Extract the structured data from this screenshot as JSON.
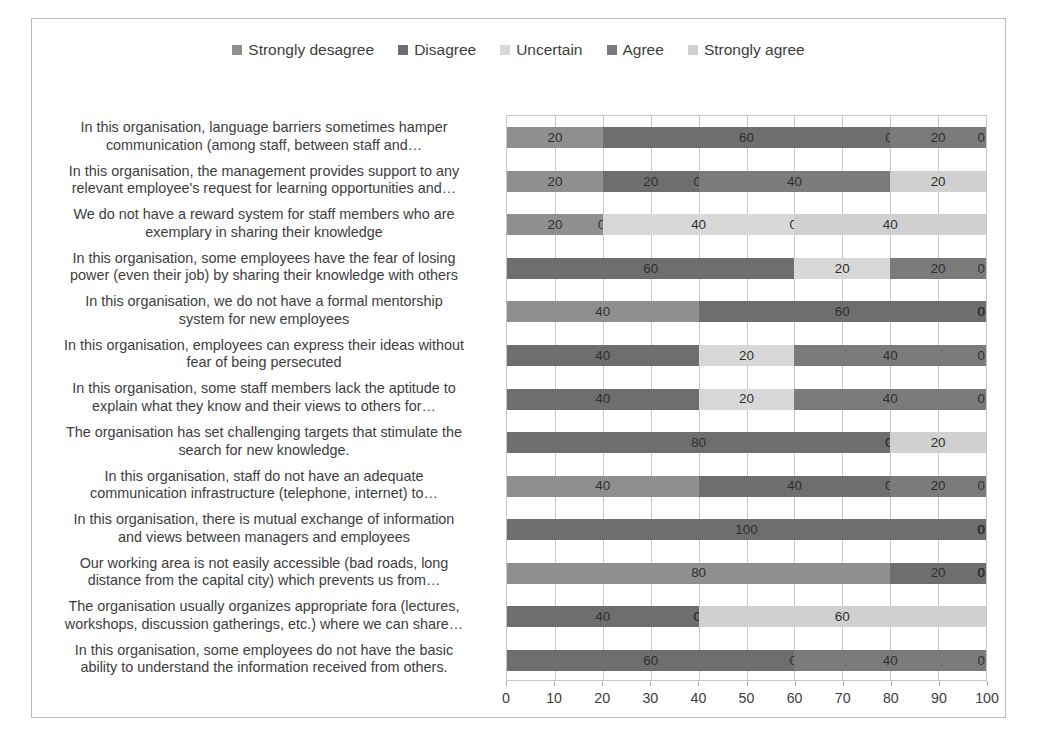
{
  "chart_data": {
    "type": "bar",
    "subtype": "stacked-horizontal-100",
    "title": "",
    "xlabel": "",
    "ylabel": "",
    "xlim": [
      0,
      100
    ],
    "xticks": [
      "0",
      "10",
      "20",
      "30",
      "40",
      "50",
      "60",
      "70",
      "80",
      "90",
      "100"
    ],
    "grid": true,
    "legend_position": "top-center",
    "series": [
      {
        "name": "Strongly desagree",
        "color": "#8f8f8f",
        "values": [
          20,
          20,
          20,
          0,
          40,
          0,
          0,
          0,
          40,
          0,
          80,
          0,
          0
        ]
      },
      {
        "name": "Disagree",
        "color": "#6e6e6e",
        "values": [
          60,
          20,
          0,
          60,
          60,
          40,
          40,
          80,
          40,
          100,
          20,
          40,
          60
        ]
      },
      {
        "name": "Uncertain",
        "color": "#d8d8d8",
        "values": [
          0,
          0,
          40,
          20,
          0,
          20,
          20,
          0,
          0,
          0,
          0,
          0,
          0
        ]
      },
      {
        "name": "Agree",
        "color": "#7b7b7b",
        "values": [
          20,
          40,
          0,
          20,
          0,
          40,
          40,
          0,
          20,
          0,
          0,
          0,
          40
        ]
      },
      {
        "name": "Strongly agree",
        "color": "#d0d0d0",
        "values": [
          0,
          20,
          40,
          0,
          0,
          0,
          0,
          20,
          0,
          0,
          0,
          60,
          0
        ]
      }
    ],
    "categories": [
      "In this organisation, language barriers sometimes hamper communication (among staff, between staff and…",
      "In this organisation, the management provides support to any relevant employee's request for learning opportunities and…",
      "We do not have a reward system for staff members who are exemplary in sharing their knowledge",
      "In this organisation, some employees have the fear of losing power (even their job) by sharing their knowledge with others",
      "In this organisation, we do not have a formal mentorship system for new employees",
      "In this organisation, employees can express their ideas without fear of being persecuted",
      "In this organisation, some staff members lack the aptitude to explain what they know and their views to others for…",
      "The organisation has set challenging targets that stimulate the search for new knowledge.",
      "In this organisation, staff do not have an adequate communication infrastructure (telephone, internet) to…",
      "In this organisation, there is mutual exchange of information and views between managers and employees",
      "Our working area is not easily accessible (bad roads, long distance from the capital city) which prevents us from…",
      "The organisation usually organizes appropriate fora (lectures, workshops, discussion gatherings, etc.) where we can share…",
      "In this organisation, some employees do not have the basic ability to understand the information received from others."
    ],
    "category_lines": [
      [
        "In this organisation, language barriers sometimes hamper",
        "communication (among staff, between staff and…"
      ],
      [
        "In this organisation, the management provides support to any",
        "relevant employee's request for learning opportunities and…"
      ],
      [
        "We do not have a reward system for staff members who are",
        "exemplary in sharing their knowledge"
      ],
      [
        "In this organisation, some employees have the fear of losing",
        "power (even their job) by sharing their knowledge with others"
      ],
      [
        "In this organisation, we do not have a formal mentorship",
        "system for new employees"
      ],
      [
        "In this organisation, employees can express their ideas without",
        "fear of being persecuted"
      ],
      [
        "In this organisation, some staff members lack the aptitude to",
        "explain what they know and their views to others for…"
      ],
      [
        "The organisation has set challenging targets that stimulate the",
        "search for new knowledge."
      ],
      [
        "In this organisation, staff do not have an adequate",
        "communication infrastructure (telephone, internet) to…"
      ],
      [
        "In this organisation, there is mutual exchange of information",
        "and views between managers and employees"
      ],
      [
        "Our working area is not easily accessible (bad roads, long",
        "distance from the capital city) which prevents us from…"
      ],
      [
        "The organisation usually organizes appropriate fora (lectures,",
        "workshops, discussion gatherings, etc.) where we can share…"
      ],
      [
        "In this organisation, some employees do not have the basic",
        "ability to understand the information received from others."
      ]
    ],
    "rows": [
      {
        "segments": [
          20,
          60,
          0,
          20,
          0
        ]
      },
      {
        "segments": [
          20,
          20,
          0,
          40,
          20
        ]
      },
      {
        "segments": [
          20,
          0,
          40,
          0,
          40
        ]
      },
      {
        "segments": [
          0,
          60,
          20,
          20,
          0
        ]
      },
      {
        "segments": [
          40,
          60,
          0,
          0,
          0
        ]
      },
      {
        "segments": [
          0,
          40,
          20,
          40,
          0
        ]
      },
      {
        "segments": [
          0,
          40,
          20,
          40,
          0
        ]
      },
      {
        "segments": [
          0,
          80,
          0,
          0,
          20
        ]
      },
      {
        "segments": [
          40,
          40,
          0,
          20,
          0
        ]
      },
      {
        "segments": [
          0,
          100,
          0,
          0,
          0
        ]
      },
      {
        "segments": [
          80,
          20,
          0,
          0,
          0
        ]
      },
      {
        "segments": [
          0,
          40,
          0,
          0,
          60
        ]
      },
      {
        "segments": [
          0,
          60,
          0,
          40,
          0
        ]
      }
    ]
  },
  "legend": {
    "items": [
      {
        "label": "Strongly desagree",
        "color": "#8f8f8f"
      },
      {
        "label": "Disagree",
        "color": "#6e6e6e"
      },
      {
        "label": "Uncertain",
        "color": "#d8d8d8"
      },
      {
        "label": "Agree",
        "color": "#7b7b7b"
      },
      {
        "label": "Strongly agree",
        "color": "#d0d0d0"
      }
    ]
  }
}
